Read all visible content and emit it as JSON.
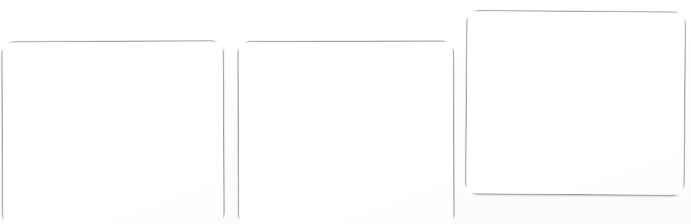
{
  "canvas": {
    "width": 691,
    "height": 224,
    "background_color": "#ffffff",
    "description": "Three blank rounded rectangle cards on a white background"
  },
  "style": {
    "card_fill": "#ffffff",
    "card_border_color": "#9e9e9e",
    "card_border_width_px": 1,
    "card_corner_radius_px": 13,
    "shadow_color": "#787878"
  },
  "cards": [
    {
      "id": "card-1",
      "label": "",
      "x": 2,
      "y": 41,
      "width": 222,
      "height": 185,
      "rotation_deg": -0.25,
      "content": ""
    },
    {
      "id": "card-2",
      "label": "",
      "x": 238,
      "y": 41,
      "width": 216,
      "height": 185,
      "rotation_deg": -0.2,
      "content": ""
    },
    {
      "id": "card-3",
      "label": "",
      "x": 466,
      "y": 11,
      "width": 219,
      "height": 184,
      "rotation_deg": 0.45,
      "content": ""
    }
  ]
}
